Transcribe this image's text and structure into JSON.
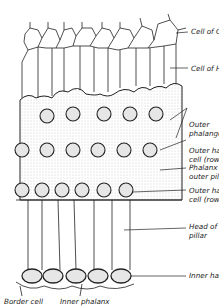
{
  "figure": {
    "labels": {
      "cell_of_claudius": "Cell of Claudius",
      "cell_of_hensen": "Cell of Hensen",
      "outer_phalanges_1": "Outer",
      "outer_phalanges_2": "phalanges",
      "outer_hair_cell_row2_1": "Outer hair",
      "outer_hair_cell_row2_2": "cell (row 2)",
      "phalanx_outer_pillar_1": "Phalanx of",
      "phalanx_outer_pillar_2": "outer pillar",
      "outer_hair_cell_row1_1": "Outer hair",
      "outer_hair_cell_row1_2": "cell (row 1)",
      "head_inner_pillar_1": "Head of inner",
      "head_inner_pillar_2": "pillar",
      "inner_hair_cell": "Inner hair cell",
      "border_cell": "Border cell",
      "inner_phalanx": "Inner phalanx"
    },
    "colors": {
      "line": "#222222",
      "stipple": "#d8d8d8",
      "cell_fill": "#e6e6e6"
    }
  }
}
